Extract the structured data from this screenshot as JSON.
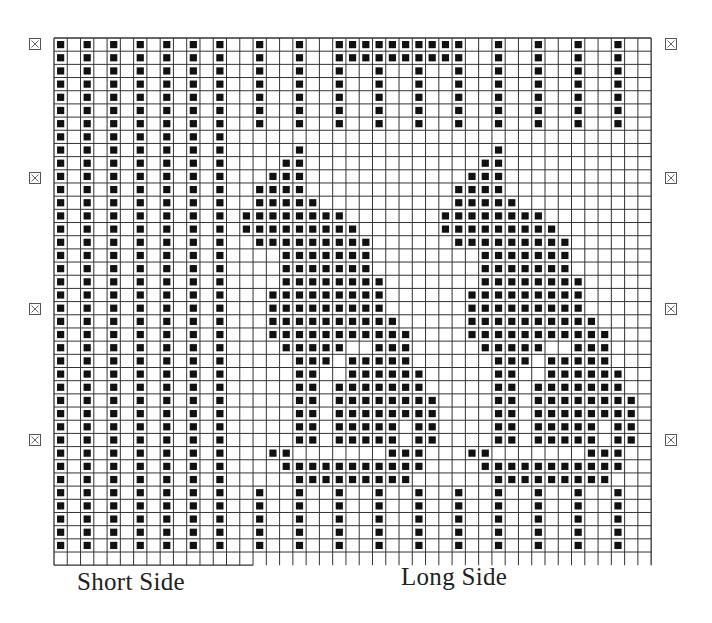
{
  "grid": {
    "cols": 45,
    "rows": 40,
    "left": 54,
    "top": 38,
    "cell_w": 13.27,
    "cell_h": 13.18,
    "line_color": "#333333",
    "fill_color": "#111111",
    "short_side_cols": 15,
    "legend_symbol": "filled square = contrast stitch"
  },
  "pattern_rows": [
    "X.X.X.X.X.X.X..X..X..XXXXXXXXXX..X..X..X..X..",
    "X.X.X.X.X.X.X..X..X..XXXXXXXXXX..X..X..X..X..",
    "X.X.X.X.X.X.X..X..X..X..X..X..X..X..X..X..X..",
    "X.X.X.X.X.X.X..X..X..X..X..X..X..X..X..X..X..",
    "X.X.X.X.X.X.X..X..X..X..X..X..X..X..X..X..X..",
    "X.X.X.X.X.X.X..X..X..X..X..X..X..X..X..X..X..",
    "X.X.X.X.X.X.X..X..X..X..X..X..X..X..X..X..X..",
    "X.X.X.X.X.X.X................................",
    "X.X.X.X.X.X.X.....X..............X...........",
    "X.X.X.X.X.X.X....XX.............XX...........",
    "X.X.X.X.X.X.X...XXX............XXX...........",
    "X.X.X.X.X.X.X..XXXX...........XXXX...........",
    "X.X.X.X.X.X.X..XXXXX..........XXXXX..........",
    "X.X.X.X.X.X.X.XXXXXXXX.......XXXXXXXX........",
    "X.X.X.X.X.X.X.XXXXXXXXX......XXXXXXXXX.......",
    "X.X.X.X.X.X.X..XXXXXXXXX......XXXXXXXXX......",
    "X.X.X.X.X.X.X....XXXXXXX........XXXXXXX......",
    "X.X.X.X.X.X.X....XXXXXXX........XXXXXXX......",
    "X.X.X.X.X.X.X....XXXXXXXX.......XXXXXXXX.....",
    "X.X.X.X.X.X.X...XXXXXXXXX......XXXXXXXXX.....",
    "X.X.X.X.X.X.X...XXXXXXXXX......XXXXXXXXX.....",
    "X.X.X.X.X.X.X...XXXXXXXXXX.....XXXXXXXXXX....",
    "X.X.X.X.X.X.X...XXXXXXXXXXX....XXXXXXXXXXX...",
    "X.X.X.X.X.X.X....XXXXX..XXX.....XXXXX..XXX...",
    "X.X.X.X.X.X.X.....XXX.XXXXX......XXX.XXXXX...",
    "X.X.X.X.X.X.X.....XX..XXXXXX.....XX..XXXXXX..",
    "X.X.X.X.X.X.X.....XX.XXXXXXX.....XX.XXXXXXX..",
    "X.X.X.X.X.X.X.....XX.XXXXXXXX....XX.XXXXXXXX.",
    "X.X.X.X.X.X.X.....XX.XXXXXXXX....XX.XXXXXXXX.",
    "X.X.X.X.X.X.X.....XX.XXXXX.XX....XX.XXXXX.XX.",
    "X.X.X.X.X.X.X.....XX.XXXXX.XX....XX.XXXXX.XX.",
    "X.X.X.X.X.X.X...XX.......XXX...XX.......XXX..",
    "X.X.X.X.X.X.X....XXXXXXXXXXX....XXXXXXXXXXX..",
    "X.X.X.X.X.X.X.....XXXXXXXXX......XXXXXXXXX...",
    "X.X.X.X.X.X.X..X..X..X..X..X..X..X..X..X..X..",
    "X.X.X.X.X.X.X..X..X..X..X..X..X..X..X..X..X..",
    "X.X.X.X.X.X.X..X..X..X..X..X..X..X..X..X..X..",
    "X.X.X.X.X.X.X..X..X..X..X..X..X..X..X..X..X..",
    "X.X.X.X.X.X.X..X..X..X..X..X..X..X..X..X..X..",
    "............................................."
  ],
  "markers": {
    "icon": "boxed-x-icon",
    "left_x": 29,
    "right_x": 665,
    "y": [
      38,
      172,
      303,
      434
    ]
  },
  "labels": {
    "short_side": "Short Side",
    "long_side": "Long Side"
  },
  "label_positions": {
    "short_side": {
      "x": 77,
      "y": 568
    },
    "long_side": {
      "x": 401,
      "y": 563
    }
  }
}
